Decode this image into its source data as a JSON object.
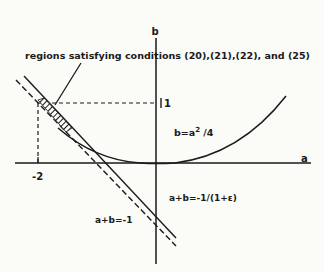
{
  "figure": {
    "axes": {
      "x_label": "a",
      "y_label": "b",
      "x_tick": "-2",
      "y_tick": "1"
    },
    "annotations": {
      "region_label": "regions satisfying conditions (20),(21),(22), and (25)",
      "parabola_label": "b=a",
      "parabola_exp": "2",
      "parabola_tail": " /4",
      "line_solid_label": "a+b=-1/(1+ε)",
      "line_dashed_label": "a+b=-1"
    },
    "colors": {
      "ink": "#1a1a1a",
      "background": "#fbfbf8"
    }
  }
}
